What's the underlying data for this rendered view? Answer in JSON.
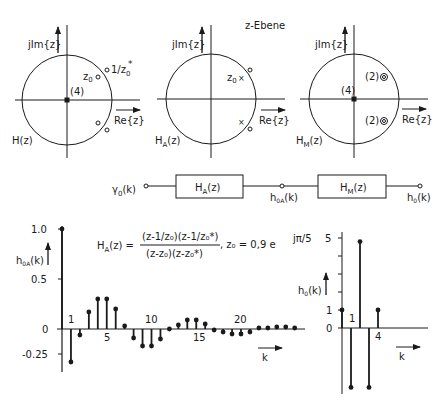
{
  "title": "z-Ebene",
  "pole_zero_plots": [
    {
      "id": "H",
      "name": "H(z)",
      "name_main": "H",
      "name_sub": "",
      "name_arg": "(z)",
      "imag_axis_label": "jIm{z}",
      "real_axis_label": "Re{z}",
      "origin_label": "(4)",
      "zero_label_inner": "z",
      "zero_label_inner_sub": "0",
      "zero_label_outer": "1/z",
      "zero_label_outer_sub": "0",
      "zero_label_outer_sup": "*"
    },
    {
      "id": "HA",
      "name": "H_A(z)",
      "name_main": "H",
      "name_sub": "A",
      "name_arg": "(z)",
      "imag_axis_label": "jIm{z}",
      "real_axis_label": "Re{z}",
      "pole_label": "z",
      "pole_label_sub": "0"
    },
    {
      "id": "HM",
      "name": "H_M(z)",
      "name_main": "H",
      "name_sub": "M",
      "name_arg": "(z)",
      "imag_axis_label": "jIm{z}",
      "real_axis_label": "Re{z}",
      "origin_label": "(4)",
      "double_zero_label_upper": "(2)",
      "double_zero_label_lower": "(2)"
    }
  ],
  "block_diagram": {
    "input_main": "γ",
    "input_sub": "0",
    "input_arg": "(k)",
    "block1_main": "H",
    "block1_sub": "A",
    "block1_arg": "(z)",
    "mid_main": "h",
    "mid_sub": "0A",
    "mid_arg": "(k)",
    "block2_main": "H",
    "block2_sub": "M",
    "block2_arg": "(z)",
    "output_main": "h",
    "output_sub": "0",
    "output_arg": "(k)"
  },
  "formula": {
    "lhs_main": "H",
    "lhs_sub": "A",
    "lhs_arg": "(z) =",
    "numerator": "(z-1/z₀)(z-1/z₀*)",
    "denominator": "(z-z₀)(z-z₀*)",
    "param": ",  z₀ = 0,9 e",
    "param_exp": "jπ/5"
  },
  "chart_data": [
    {
      "type": "stem",
      "title": "",
      "ylabel": "h0A(k)",
      "ylabel_main": "h",
      "ylabel_sub": "0A",
      "ylabel_arg": "(k)",
      "xlabel": "k",
      "ytick_labels": [
        "1.0",
        "0.5",
        "0",
        "-0.25"
      ],
      "yticks": [
        1.0,
        0.5,
        0,
        -0.25
      ],
      "xtick_labels": [
        "1",
        "5",
        "10",
        "15",
        "20"
      ],
      "xticks": [
        1,
        5,
        10,
        15,
        20
      ],
      "ylim": [
        -0.35,
        1.0
      ],
      "x": [
        0,
        1,
        2,
        3,
        4,
        5,
        6,
        7,
        8,
        9,
        10,
        11,
        12,
        13,
        14,
        15,
        16,
        17,
        18,
        19,
        20,
        21,
        22,
        23,
        24,
        25,
        26
      ],
      "values": [
        1.0,
        -0.33,
        -0.06,
        0.17,
        0.3,
        0.3,
        0.2,
        0.03,
        -0.09,
        -0.17,
        -0.17,
        -0.1,
        0.0,
        0.04,
        0.09,
        0.09,
        0.05,
        -0.01,
        -0.03,
        -0.05,
        -0.05,
        -0.03,
        0.01,
        0.01,
        0.02,
        0.02,
        0.01
      ]
    },
    {
      "type": "stem",
      "title": "",
      "ylabel": "h0(k)",
      "ylabel_main": "h",
      "ylabel_sub": "0",
      "ylabel_arg": "(k)",
      "xlabel": "k",
      "ytick_labels": [
        "5",
        "1",
        "0"
      ],
      "yticks": [
        5,
        1,
        0
      ],
      "xtick_labels": [
        "1",
        "4"
      ],
      "xticks": [
        1,
        4
      ],
      "ylim": [
        -3.5,
        5
      ],
      "x": [
        0,
        1,
        2,
        3,
        4
      ],
      "values": [
        1.0,
        -3.3,
        4.8,
        -3.3,
        1.0
      ]
    }
  ]
}
